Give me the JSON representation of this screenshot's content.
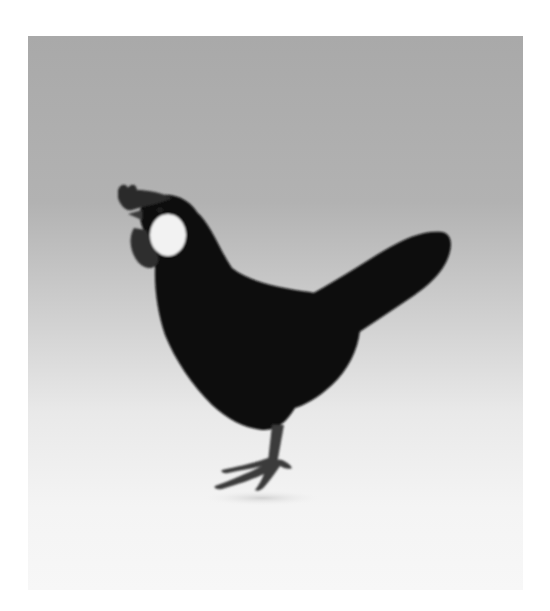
{
  "image": {
    "subject": "black hen with white earlobe standing in profile",
    "background": "grey-to-white studio gradient",
    "colors": {
      "bird_body": "#0b0b0b",
      "comb_wattle": "#2a2a2a",
      "earlobe": "#f2f2f2",
      "legs": "#3a3a3a",
      "bg_top": "#a9a9a9",
      "bg_bottom": "#f7f7f7"
    }
  },
  "caption_fragment": ""
}
